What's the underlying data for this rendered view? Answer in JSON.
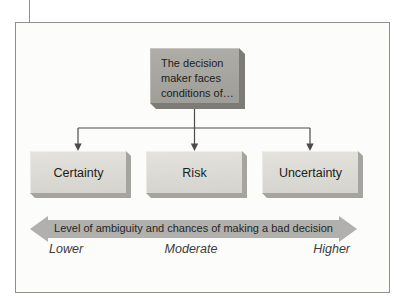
{
  "figure": {
    "root_box": {
      "label": "The decision maker faces conditions of…"
    },
    "condition_boxes": [
      {
        "label": "Certainty"
      },
      {
        "label": "Risk"
      },
      {
        "label": "Uncertainty"
      }
    ],
    "axis_arrow": {
      "label": "Level of ambiguity and chances of making a bad decision"
    },
    "scale_labels": [
      {
        "label": "Lower"
      },
      {
        "label": "Moderate"
      },
      {
        "label": "Higher"
      }
    ],
    "colors": {
      "root_box_fill": "#a6a5a0",
      "root_box_shadow": "#7c7b76",
      "condition_box_fill": "#dcdbd5",
      "condition_box_shadow": "#a5a49e",
      "arrow_band": "#b1b0ac",
      "connector_line": "#4c4b47",
      "frame_border": "#8f8f8d",
      "text": "#1d1d1b"
    }
  }
}
